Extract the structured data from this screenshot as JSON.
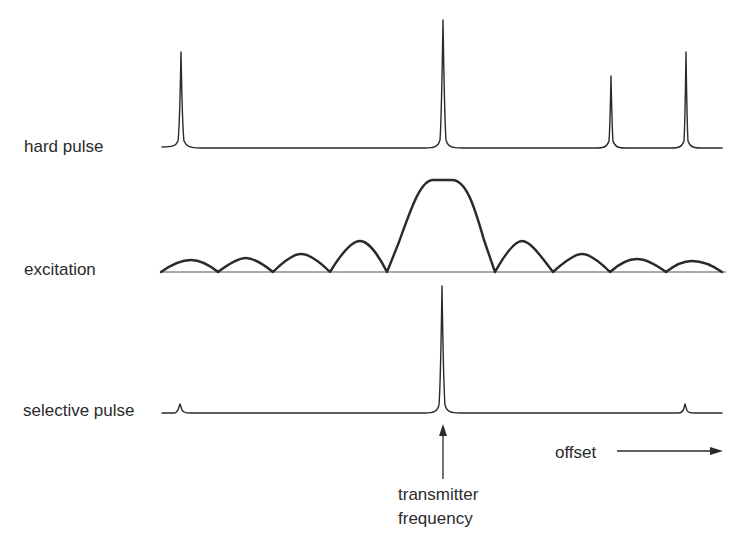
{
  "figure": {
    "traces": [
      {
        "id": "hard",
        "label": "hard pulse"
      },
      {
        "id": "excitation",
        "label": "excitation"
      },
      {
        "id": "selective",
        "label": "selective pulse"
      }
    ],
    "annotations": {
      "transmitter_line1": "transmitter",
      "transmitter_line2": "frequency",
      "offset": "offset"
    },
    "hard_pulse_peaks": [
      {
        "x": 181,
        "top": 52
      },
      {
        "x": 443,
        "top": 20
      },
      {
        "x": 611,
        "top": 76
      },
      {
        "x": 686,
        "top": 52
      }
    ],
    "selective_pulse_peaks": [
      {
        "x": 180,
        "top": 404
      },
      {
        "x": 442,
        "top": 286
      },
      {
        "x": 685,
        "top": 404
      }
    ],
    "colors": {
      "stroke": "#2a2a2a",
      "text": "#2b2b2b",
      "background": "#ffffff"
    }
  }
}
